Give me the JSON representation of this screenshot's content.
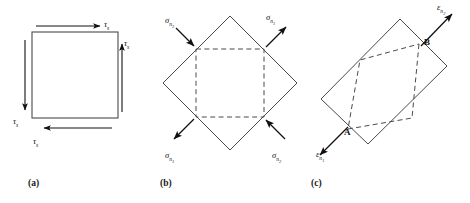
{
  "figure": {
    "panels": [
      {
        "id": "a",
        "caption": "(a)",
        "shape": "square",
        "shape_name": "shear-element-square",
        "labels": [
          {
            "id": "a-top",
            "symbol": "τ",
            "subscript": "s",
            "position": "top",
            "arrow_direction": "right"
          },
          {
            "id": "a-right",
            "symbol": "τ",
            "subscript": "s",
            "position": "right",
            "arrow_direction": "up"
          },
          {
            "id": "a-left",
            "symbol": "τ",
            "subscript": "s",
            "position": "left",
            "arrow_direction": "down"
          },
          {
            "id": "a-bottom",
            "symbol": "τ",
            "subscript": "s",
            "position": "bottom",
            "arrow_direction": "left"
          }
        ]
      },
      {
        "id": "b",
        "caption": "(b)",
        "shape": "diamond-with-dashed-inner-square",
        "shape_name": "principal-stress-element",
        "labels": [
          {
            "id": "b-tl",
            "symbol": "σ",
            "subscript": "n",
            "subsubscript": "2",
            "position": "top-left",
            "arrow_direction": "inward-down-right"
          },
          {
            "id": "b-tr",
            "symbol": "σ",
            "subscript": "n",
            "subsubscript": "1",
            "position": "top-right",
            "arrow_direction": "outward-up-right"
          },
          {
            "id": "b-bl",
            "symbol": "σ",
            "subscript": "n",
            "subsubscript": "1",
            "position": "bottom-left",
            "arrow_direction": "outward-down-left"
          },
          {
            "id": "b-br",
            "symbol": "σ",
            "subscript": "n",
            "subsubscript": "2",
            "position": "bottom-right",
            "arrow_direction": "inward-up-left"
          }
        ]
      },
      {
        "id": "c",
        "caption": "(c)",
        "shape": "tilted-rectangle-with-dashed-inner-parallelogram",
        "shape_name": "deformed-strain-element",
        "labels": [
          {
            "id": "c-tr",
            "symbol": "ε",
            "subscript": "n",
            "subsubscript": "2",
            "position": "top-right",
            "arrow_direction": "outward-up-right"
          },
          {
            "id": "c-bl",
            "symbol": "ε",
            "subscript": "n",
            "subsubscript": "1",
            "position": "bottom-left",
            "arrow_direction": "outward-down-left"
          }
        ],
        "points": [
          {
            "id": "c-A",
            "label": "A",
            "position": "bottom-left-vertex"
          },
          {
            "id": "c-B",
            "label": "B",
            "position": "top-right-vertex"
          }
        ]
      }
    ]
  },
  "colors": {
    "stroke": "#333333",
    "arrow": "#111111",
    "dashed": "#444444",
    "text": "#111111",
    "background": "#ffffff"
  }
}
